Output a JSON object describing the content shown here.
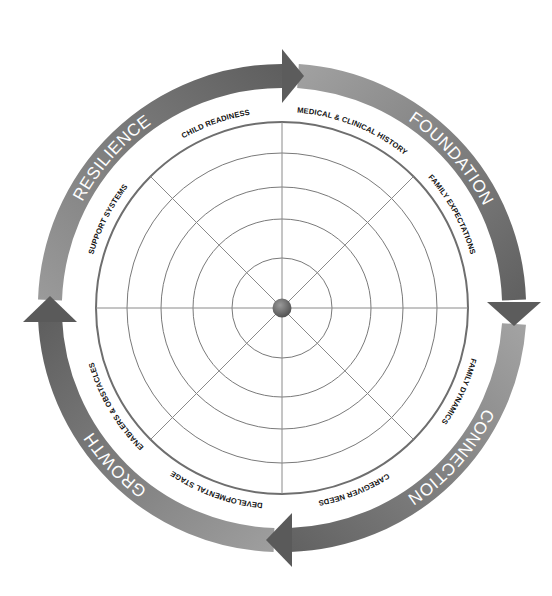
{
  "diagram": {
    "type": "circular cycle wheel with radar grid",
    "phases": [
      {
        "id": "foundation",
        "label": "FOUNDATION"
      },
      {
        "id": "connection",
        "label": "CONNECTION"
      },
      {
        "id": "growth",
        "label": "GROWTH"
      },
      {
        "id": "resilience",
        "label": "RESILIENCE"
      }
    ],
    "dimensions": [
      {
        "id": "medical",
        "label": "MEDICAL & CLINICAL HISTORY"
      },
      {
        "id": "expectations",
        "label": "FAMILY EXPECTATIONS"
      },
      {
        "id": "dynamics",
        "label": "FAMILY DYNAMICS"
      },
      {
        "id": "caregiver",
        "label": "CAREGIVER NEEDS"
      },
      {
        "id": "developmental",
        "label": "DEVELOPMENTAL STAGE"
      },
      {
        "id": "enablers",
        "label": "ENABLERS & OBSTACLES"
      },
      {
        "id": "support",
        "label": "SUPPORT SYSTEMS"
      },
      {
        "id": "child",
        "label": "CHILD READINESS"
      }
    ],
    "grid": {
      "rings": 5,
      "spokes": 8
    },
    "colors": {
      "band_light": "#9a9a9a",
      "band_dark": "#5c5c5c",
      "grid_line": "#7a7a7a",
      "outer_ring": "#6e6e6e",
      "center_dot": "#6a6a6a",
      "label_text": "#111111",
      "phase_text": "#ffffff"
    }
  }
}
